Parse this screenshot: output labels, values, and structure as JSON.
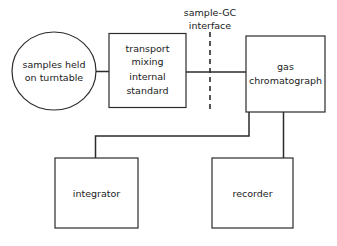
{
  "diagram": {
    "background_color": "#ffffff",
    "stroke_color": "#2b2b2b",
    "nodes": [
      {
        "id": "turntable",
        "shape": "ellipse",
        "lines": [
          "samples held",
          "on turntable"
        ]
      },
      {
        "id": "transport",
        "shape": "rectangle",
        "lines": [
          "transport",
          "mixing",
          "internal",
          "standard"
        ]
      },
      {
        "id": "gas-chromatograph",
        "shape": "rectangle",
        "lines": [
          "gas",
          "chromatograph"
        ]
      },
      {
        "id": "integrator",
        "shape": "rectangle",
        "lines": [
          "integrator"
        ]
      },
      {
        "id": "recorder",
        "shape": "rectangle",
        "lines": [
          "recorder"
        ]
      }
    ],
    "annotations": [
      {
        "id": "sample-gc-interface",
        "lines": [
          "sample-GC",
          "interface"
        ],
        "marker": "vertical-dashed-line"
      }
    ]
  }
}
